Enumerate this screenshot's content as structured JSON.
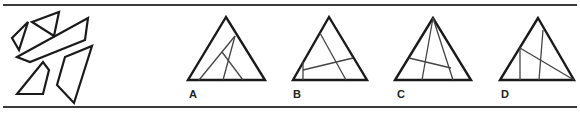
{
  "puzzle": {
    "pieces_label": "",
    "options": [
      {
        "label": "A",
        "label_pos": [
          189,
          89
        ],
        "triangle": [
          [
            226,
            17
          ],
          [
            188,
            80
          ],
          [
            265,
            80
          ]
        ],
        "lines": [
          [
            [
              199,
              80
            ],
            [
              235,
              36
            ]
          ],
          [
            [
              223,
              80
            ],
            [
              235,
              36
            ]
          ],
          [
            [
              222,
              52
            ],
            [
              243,
              80
            ]
          ]
        ]
      },
      {
        "label": "B",
        "label_pos": [
          293,
          89
        ],
        "triangle": [
          [
            329,
            17
          ],
          [
            293,
            80
          ],
          [
            367,
            80
          ]
        ],
        "lines": [
          [
            [
              320,
              33
            ],
            [
              346,
              80
            ]
          ],
          [
            [
              303,
              70
            ],
            [
              353,
              58
            ]
          ],
          [
            [
              303,
              62
            ],
            [
              303,
              80
            ]
          ]
        ]
      },
      {
        "label": "C",
        "label_pos": [
          397,
          89
        ],
        "triangle": [
          [
            433,
            18
          ],
          [
            395,
            80
          ],
          [
            471,
            80
          ]
        ],
        "lines": [
          [
            [
              433,
              18
            ],
            [
              422,
              80
            ]
          ],
          [
            [
              433,
              18
            ],
            [
              453,
              80
            ]
          ],
          [
            [
              409,
              58
            ],
            [
              451,
              68
            ]
          ]
        ]
      },
      {
        "label": "D",
        "label_pos": [
          501,
          89
        ],
        "triangle": [
          [
            538,
            18
          ],
          [
            500,
            80
          ],
          [
            574,
            80
          ]
        ],
        "lines": [
          [
            [
              520,
              48
            ],
            [
              574,
              80
            ]
          ],
          [
            [
              520,
              48
            ],
            [
              520,
              80
            ]
          ],
          [
            [
              543,
              30
            ],
            [
              539,
              80
            ]
          ]
        ]
      }
    ],
    "pieces": [
      [
        [
          12,
          38
        ],
        [
          28,
          22
        ],
        [
          19,
          50
        ]
      ],
      [
        [
          32,
          22
        ],
        [
          59,
          12
        ],
        [
          54,
          36
        ]
      ],
      [
        [
          17,
          57
        ],
        [
          88,
          18
        ],
        [
          85,
          40
        ],
        [
          30,
          62
        ]
      ],
      [
        [
          17,
          94
        ],
        [
          43,
          62
        ],
        [
          49,
          70
        ],
        [
          43,
          94
        ]
      ],
      [
        [
          57,
          85
        ],
        [
          65,
          57
        ],
        [
          92,
          46
        ],
        [
          74,
          103
        ]
      ]
    ]
  }
}
